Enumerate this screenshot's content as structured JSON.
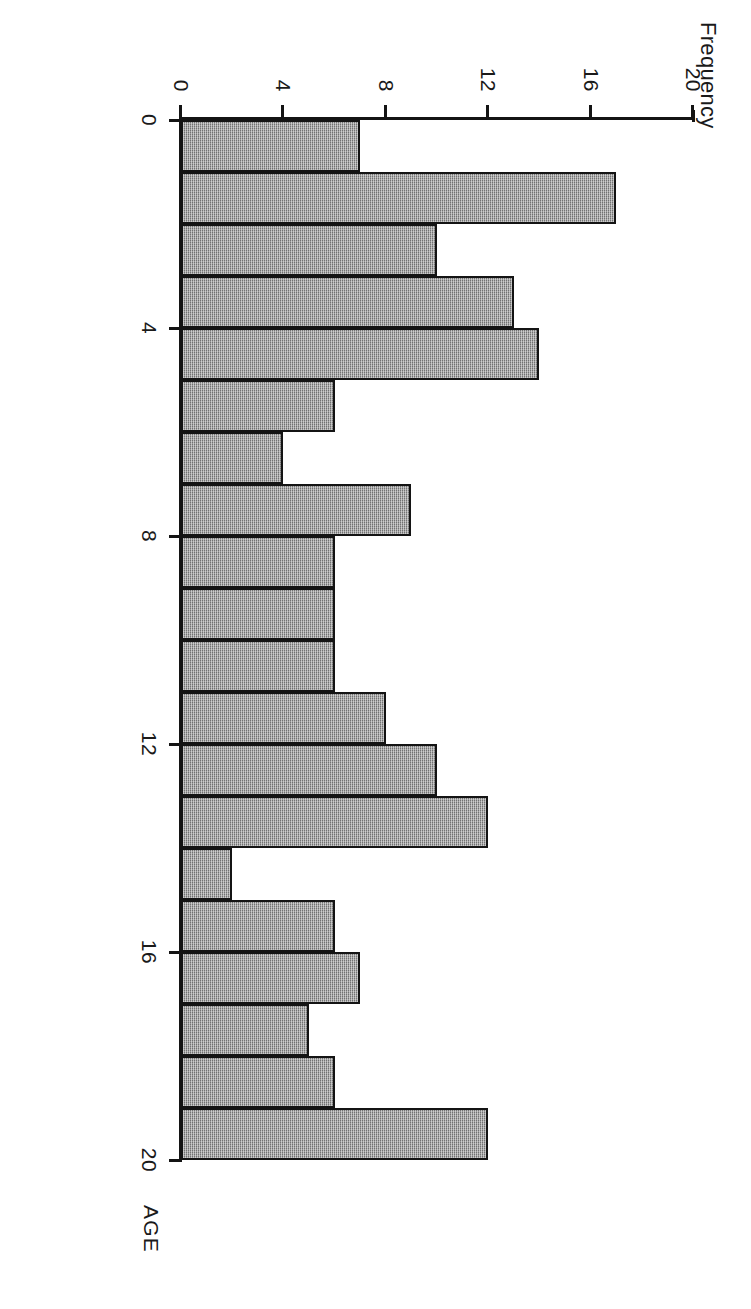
{
  "figure": {
    "orientation_note": "rotated-90-clockwise-scan",
    "ylabel": "Frequency",
    "xlabel": "AGE"
  },
  "chart_data": {
    "type": "bar",
    "title": "",
    "subtitle": "",
    "xlabel": "AGE",
    "ylabel": "Frequency",
    "xlim": [
      0,
      20
    ],
    "ylim": [
      0,
      20
    ],
    "xticks": [
      0,
      4,
      8,
      12,
      16,
      20
    ],
    "yticks": [
      0,
      4,
      8,
      12,
      16,
      20
    ],
    "xtick_labels": [
      "0",
      "4",
      "8",
      "12",
      "16",
      "20"
    ],
    "ytick_labels": [
      "0",
      "4",
      "8",
      "12",
      "16",
      "20"
    ],
    "grid": false,
    "legend": null,
    "bar_fill_color": "#9a9a9a",
    "bar_edge_color": "#141414",
    "bin_width": 1,
    "categories": [
      "0-1",
      "1-2",
      "2-3",
      "3-4",
      "4-5",
      "5-6",
      "6-7",
      "7-8",
      "8-9",
      "9-10",
      "10-11",
      "11-12",
      "12-13",
      "13-14",
      "14-15",
      "15-16",
      "16-17",
      "17-18",
      "18-19",
      "19-20"
    ],
    "bin_starts": [
      0,
      1,
      2,
      3,
      4,
      5,
      6,
      7,
      8,
      9,
      10,
      11,
      12,
      13,
      14,
      15,
      16,
      17,
      18,
      19
    ],
    "values": [
      7,
      17,
      10,
      13,
      14,
      6,
      4,
      9,
      6,
      6,
      6,
      8,
      10,
      12,
      2,
      6,
      7,
      5,
      6,
      12
    ]
  }
}
